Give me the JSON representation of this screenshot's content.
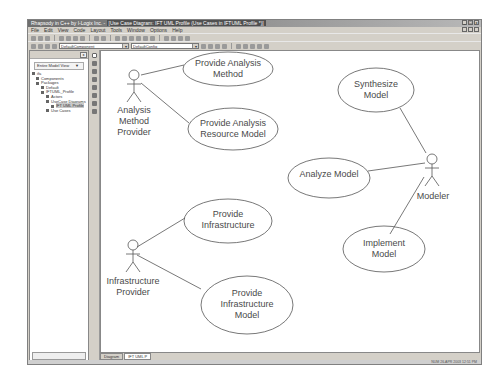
{
  "window": {
    "app_title": "Rhapsody in C++ by I-Logix Inc.",
    "doc_title": "[Use Case Diagram: IFT UML Profile (Use Cases in IFTUML Profile *)]",
    "controls": [
      "minimize",
      "maximize",
      "close"
    ]
  },
  "menu": [
    "File",
    "Edit",
    "View",
    "Code",
    "Layout",
    "Tools",
    "Window",
    "Options",
    "Help"
  ],
  "toolbar2": {
    "combo1": "DefaultComponent",
    "combo2": "DefaultConfig"
  },
  "browser": {
    "view_selector": "Entire Model View",
    "tree": [
      {
        "label": "ifa",
        "indent": 0
      },
      {
        "label": "Components",
        "indent": 1
      },
      {
        "label": "Packages",
        "indent": 1
      },
      {
        "label": "Default",
        "indent": 2
      },
      {
        "label": "IFTUML_Profile",
        "indent": 2
      },
      {
        "label": "Actors",
        "indent": 3
      },
      {
        "label": "UseCase Diagrams",
        "indent": 3
      },
      {
        "label": "IFT UML Profile",
        "indent": 4,
        "selected": true
      },
      {
        "label": "Use Cases",
        "indent": 3
      }
    ]
  },
  "tabs": [
    {
      "label": "Diagram",
      "active": false
    },
    {
      "label": "IFT UML P",
      "active": true
    }
  ],
  "status": "NUM  26.APR 2003  12:51 PM",
  "diagram": {
    "actors": [
      {
        "id": "amp",
        "lines": [
          "Analysis",
          "Method",
          "Provider"
        ]
      },
      {
        "id": "ip",
        "lines": [
          "Infrastructure",
          "Provider"
        ]
      },
      {
        "id": "mod",
        "lines": [
          "Modeler"
        ]
      }
    ],
    "use_cases": [
      {
        "id": "pam",
        "lines": [
          "Provide Analysis",
          "Method"
        ]
      },
      {
        "id": "parm",
        "lines": [
          "Provide Analysis",
          "Resource Model"
        ]
      },
      {
        "id": "pi",
        "lines": [
          "Provide",
          "Infrastructure"
        ]
      },
      {
        "id": "pim",
        "lines": [
          "Provide",
          "Infrastructure",
          "Model"
        ]
      },
      {
        "id": "sm",
        "lines": [
          "Synthesize",
          "Model"
        ]
      },
      {
        "id": "am",
        "lines": [
          "Analyze Model"
        ]
      },
      {
        "id": "im",
        "lines": [
          "Implement",
          "Model"
        ]
      }
    ]
  }
}
